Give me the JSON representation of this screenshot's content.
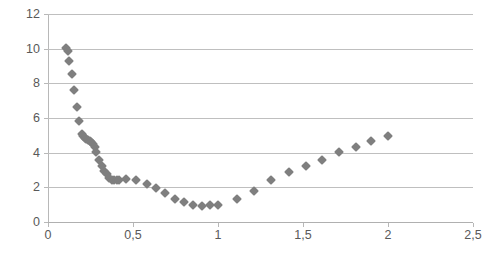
{
  "chart_data": {
    "type": "scatter",
    "title": "",
    "subtitle": "",
    "xlabel": "",
    "ylabel": "",
    "xlim": [
      0,
      2.5
    ],
    "ylim": [
      0,
      12
    ],
    "grid": true,
    "legend": null,
    "legend_position": "none",
    "marker": {
      "shape": "diamond",
      "color": "#7f7f7f",
      "size": 7
    },
    "decimal_separator": ",",
    "x_ticks": [
      0,
      0.5,
      1,
      1.5,
      2,
      2.5
    ],
    "x_tick_labels": [
      "0",
      "0,5",
      "1",
      "1,5",
      "2",
      "2,5"
    ],
    "y_ticks": [
      0,
      2,
      4,
      6,
      8,
      10,
      12
    ],
    "y_tick_labels": [
      "0",
      "2",
      "4",
      "6",
      "8",
      "10",
      "12"
    ],
    "series": [
      {
        "name": "series-1",
        "points": [
          [
            0.105,
            10.05
          ],
          [
            0.115,
            9.85
          ],
          [
            0.125,
            9.3
          ],
          [
            0.14,
            8.55
          ],
          [
            0.155,
            7.6
          ],
          [
            0.17,
            6.65
          ],
          [
            0.185,
            5.8
          ],
          [
            0.2,
            5.1
          ],
          [
            0.205,
            4.95
          ],
          [
            0.215,
            4.85
          ],
          [
            0.225,
            4.8
          ],
          [
            0.235,
            4.75
          ],
          [
            0.245,
            4.7
          ],
          [
            0.255,
            4.6
          ],
          [
            0.265,
            4.5
          ],
          [
            0.275,
            4.35
          ],
          [
            0.285,
            4.05
          ],
          [
            0.3,
            3.6
          ],
          [
            0.315,
            3.25
          ],
          [
            0.33,
            2.95
          ],
          [
            0.345,
            2.75
          ],
          [
            0.36,
            2.55
          ],
          [
            0.375,
            2.45
          ],
          [
            0.39,
            2.4
          ],
          [
            0.405,
            2.4
          ],
          [
            0.42,
            2.4
          ],
          [
            0.46,
            2.5
          ],
          [
            0.52,
            2.4
          ],
          [
            0.58,
            2.2
          ],
          [
            0.635,
            1.95
          ],
          [
            0.69,
            1.65
          ],
          [
            0.745,
            1.35
          ],
          [
            0.8,
            1.15
          ],
          [
            0.855,
            1.0
          ],
          [
            0.905,
            0.95
          ],
          [
            0.955,
            0.98
          ],
          [
            1.0,
            1.0
          ],
          [
            1.11,
            1.35
          ],
          [
            1.21,
            1.8
          ],
          [
            1.31,
            2.45
          ],
          [
            1.42,
            2.9
          ],
          [
            1.52,
            3.25
          ],
          [
            1.61,
            3.6
          ],
          [
            1.71,
            4.05
          ],
          [
            1.81,
            4.35
          ],
          [
            1.9,
            4.65
          ],
          [
            2.0,
            4.95
          ]
        ]
      }
    ]
  }
}
